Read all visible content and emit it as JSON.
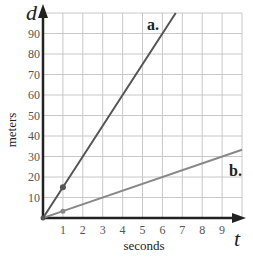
{
  "chart_data": {
    "type": "line",
    "title": "",
    "xlabel": "seconds",
    "ylabel": "meters",
    "x_variable": "t",
    "y_variable": "d",
    "xlim": [
      0,
      10
    ],
    "ylim": [
      0,
      100
    ],
    "x_ticks": [
      1,
      2,
      3,
      4,
      5,
      6,
      7,
      8,
      9
    ],
    "y_ticks": [
      10,
      20,
      30,
      40,
      50,
      60,
      70,
      80,
      90
    ],
    "grid": true,
    "legend": "inline labels",
    "series": [
      {
        "name": "a.",
        "color": "#555555",
        "slope": 15,
        "x": [
          0,
          1,
          6.67
        ],
        "y": [
          0,
          15,
          100
        ],
        "marked_point": [
          1,
          15
        ]
      },
      {
        "name": "b.",
        "color": "#888888",
        "slope": 3.33,
        "x": [
          0,
          1,
          10
        ],
        "y": [
          0,
          3.33,
          33.3
        ],
        "marked_point": [
          1,
          3.33
        ]
      }
    ]
  },
  "labels": {
    "x_axis_title": "seconds",
    "y_axis_title": "meters",
    "x_var": "t",
    "y_var": "d",
    "series_a": "a.",
    "series_b": "b."
  }
}
